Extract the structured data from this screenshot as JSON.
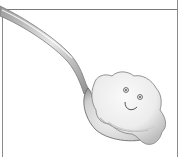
{
  "illustration": {
    "subject": "spoon holding a smiling blob",
    "style": "pencil sketch",
    "colors": {
      "background": "#ffffff",
      "frame": "#7a7a7a",
      "spoon_light": "#e8e8e8",
      "spoon_mid": "#b8b8b8",
      "spoon_dark": "#6e6e6e",
      "blob_light": "#f4f4f4",
      "blob_shade": "#c9c9c9",
      "blob_outline": "#8a8a8a",
      "face": "#555555"
    }
  }
}
